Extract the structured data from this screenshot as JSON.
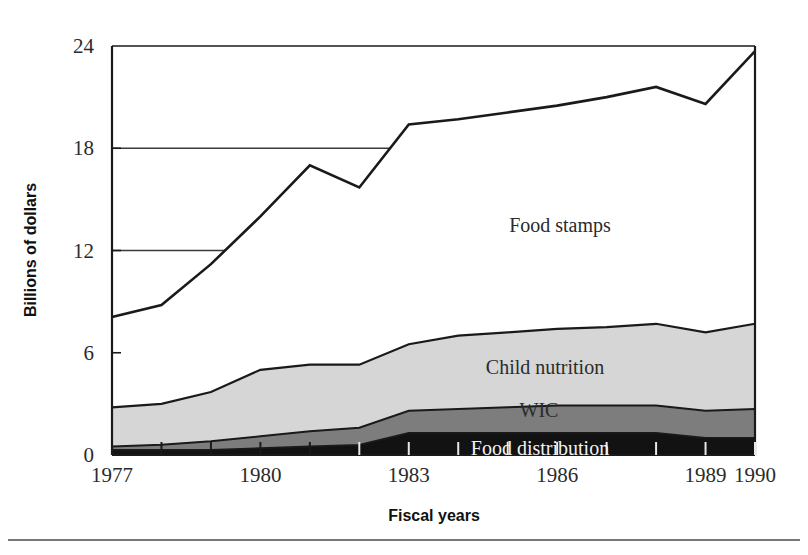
{
  "figure": {
    "background": "#ffffff",
    "bottom_rule_color": "#4a4a4a"
  },
  "axes": {
    "y_title": "Billions of dollars",
    "x_title": "Fiscal years",
    "y_ticks": [
      "0",
      "6",
      "12",
      "18",
      "24"
    ],
    "x_ticks": [
      "1977",
      "1980",
      "1983",
      "1986",
      "1989",
      "1990"
    ]
  },
  "series_labels": {
    "food_stamps": "Food stamps",
    "child_nutrition": "Child nutrition",
    "wic": "WIC",
    "food_distribution": "Food distribution"
  },
  "colors": {
    "food_stamps": "#ffffff",
    "child_nutrition": "#d6d6d6",
    "wic": "#7d7d7d",
    "food_distribution": "#121212",
    "outline": "#1a1a1a",
    "gridline": "#3a3a3a"
  },
  "chart_data": {
    "type": "area",
    "stacked": true,
    "title": "",
    "xlabel": "Fiscal years",
    "ylabel": "Billions of dollars",
    "xlim": [
      1977,
      1990
    ],
    "ylim": [
      0,
      24
    ],
    "yticks": [
      0,
      6,
      12,
      18,
      24
    ],
    "xticks": [
      1977,
      1980,
      1983,
      1986,
      1989,
      1990
    ],
    "grid": "horizontal partial gridlines at 12 and 18 drawn only left of the food stamps curve",
    "legend": "inline series labels placed inside the bands",
    "x": [
      1977,
      1978,
      1979,
      1980,
      1981,
      1982,
      1983,
      1984,
      1985,
      1986,
      1987,
      1988,
      1989,
      1990
    ],
    "series": [
      {
        "name": "Food distribution",
        "order": 1,
        "color": "#121212",
        "values": [
          0.3,
          0.3,
          0.3,
          0.4,
          0.5,
          0.6,
          1.3,
          1.3,
          1.3,
          1.3,
          1.3,
          1.3,
          1.0,
          1.0
        ]
      },
      {
        "name": "WIC",
        "order": 2,
        "color": "#7d7d7d",
        "values": [
          0.2,
          0.3,
          0.5,
          0.7,
          0.9,
          1.0,
          1.3,
          1.4,
          1.5,
          1.6,
          1.6,
          1.6,
          1.6,
          1.7
        ]
      },
      {
        "name": "Child nutrition",
        "order": 3,
        "color": "#d6d6d6",
        "values": [
          2.3,
          2.4,
          2.9,
          3.9,
          3.9,
          3.7,
          3.9,
          4.3,
          4.4,
          4.5,
          4.6,
          4.8,
          4.6,
          5.0
        ]
      },
      {
        "name": "Food stamps",
        "order": 4,
        "color": "#ffffff",
        "values": [
          5.3,
          5.8,
          7.5,
          9.0,
          11.7,
          10.4,
          12.9,
          12.7,
          12.9,
          13.1,
          13.5,
          13.9,
          13.4,
          16.0
        ]
      }
    ],
    "cumulative_totals": [
      8.1,
      8.8,
      11.2,
      14.0,
      17.0,
      15.7,
      19.4,
      19.7,
      20.1,
      20.5,
      21.0,
      21.6,
      20.6,
      23.7
    ],
    "cumulative_food_distribution": [
      0.3,
      0.3,
      0.3,
      0.4,
      0.5,
      0.6,
      1.3,
      1.3,
      1.3,
      1.3,
      1.3,
      1.3,
      1.0,
      1.0
    ],
    "cumulative_wic": [
      0.5,
      0.6,
      0.8,
      1.1,
      1.4,
      1.6,
      2.6,
      2.7,
      2.8,
      2.9,
      2.9,
      2.9,
      2.6,
      2.7
    ],
    "cumulative_child_nutrition": [
      2.8,
      3.0,
      3.7,
      5.0,
      5.3,
      5.3,
      6.5,
      7.0,
      7.2,
      7.4,
      7.5,
      7.7,
      7.2,
      7.7
    ]
  },
  "geometry": {
    "plot_left": 112,
    "plot_right": 755,
    "plot_top": 46,
    "plot_bottom": 455
  }
}
